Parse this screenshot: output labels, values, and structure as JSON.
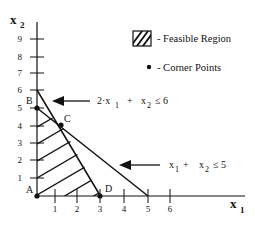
{
  "diagram": {
    "type": "linear-programming-feasible-region",
    "axes": {
      "x_label": "x",
      "x_label_sub": "1",
      "y_label": "x",
      "y_label_sub": "2",
      "x_ticks": [
        "1",
        "2",
        "3",
        "4",
        "5",
        "6"
      ],
      "y_ticks": [
        "1",
        "2",
        "3",
        "4",
        "5",
        "6",
        "7",
        "8",
        "9"
      ]
    },
    "legend": {
      "feasible_region": "- Feasible Region",
      "corner_points": "- Corner Points"
    },
    "constraints": [
      {
        "id": "c1",
        "lhs_coef": "2·x",
        "lhs_sub1": "1",
        "plus": "+",
        "x2": "x",
        "x2_sub": "2",
        "op": "≤ 6"
      },
      {
        "id": "c2",
        "lhs_coef": "x",
        "lhs_sub1": "1",
        "plus": "+",
        "x2": "x",
        "x2_sub": "2",
        "op": "≤ 5"
      }
    ],
    "corner_points": [
      {
        "label": "A",
        "x": 0,
        "y": 0
      },
      {
        "label": "B",
        "x": 0,
        "y": 5
      },
      {
        "label": "C",
        "x": 1,
        "y": 4
      },
      {
        "label": "D",
        "x": 3,
        "y": 0
      }
    ],
    "colors": {
      "ink": "#111111",
      "background": "#ffffff"
    }
  }
}
